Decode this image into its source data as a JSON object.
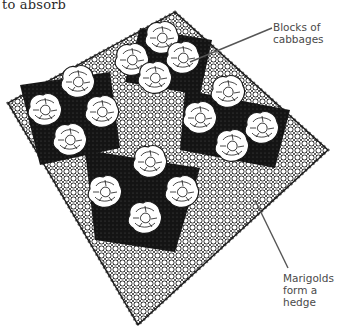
{
  "caption": {
    "text": "to absorb"
  },
  "labels": {
    "cabbages": {
      "line1": "Blocks of",
      "line2": "cabbages"
    },
    "marigolds": {
      "line1": "Marigolds",
      "line2": "form a",
      "line3": "hedge"
    }
  },
  "illustration": {
    "subject": "diamond-shaped bed with marigold hedge border surrounding four blocks of cabbages",
    "blocks": [
      {
        "position": "top",
        "cabbage_count": 4
      },
      {
        "position": "left",
        "cabbage_count": 4
      },
      {
        "position": "right",
        "cabbage_count": 4
      },
      {
        "position": "bottom",
        "cabbage_count": 4
      }
    ],
    "colors": {
      "ink": "#1a1a1a",
      "leader_line": "#555555",
      "paper": "#ffffff"
    }
  }
}
